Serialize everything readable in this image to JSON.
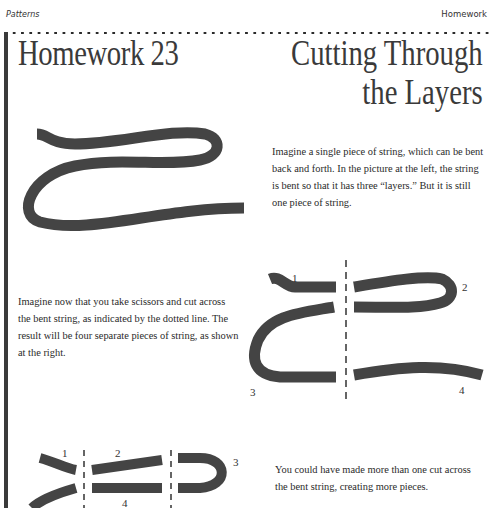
{
  "header": {
    "running_left": "Patterns",
    "running_right": "Homework"
  },
  "titles": {
    "left": "Homework 23",
    "right_line1": "Cutting Through",
    "right_line2": "the Layers"
  },
  "paragraphs": {
    "p1": "Imagine a single piece of string, which can be bent back and forth. In the picture at the left, the string is bent so that it has three “layers.” But it is still one piece of string.",
    "p2": "Imagine now that you take scissors and cut across the bent string, as indicated by the dotted line. The result will be four separate pieces of string, as shown at the right.",
    "p3": "You could have made more than one cut across the bent string, creating more pieces."
  },
  "figures": {
    "single_cut_labels": [
      "1",
      "2",
      "3",
      "4"
    ],
    "double_cut_labels": [
      "1",
      "2",
      "3",
      "4"
    ]
  },
  "colors": {
    "string": "#444444",
    "text": "#2a2a2a",
    "bar": "#3a3a3a"
  }
}
